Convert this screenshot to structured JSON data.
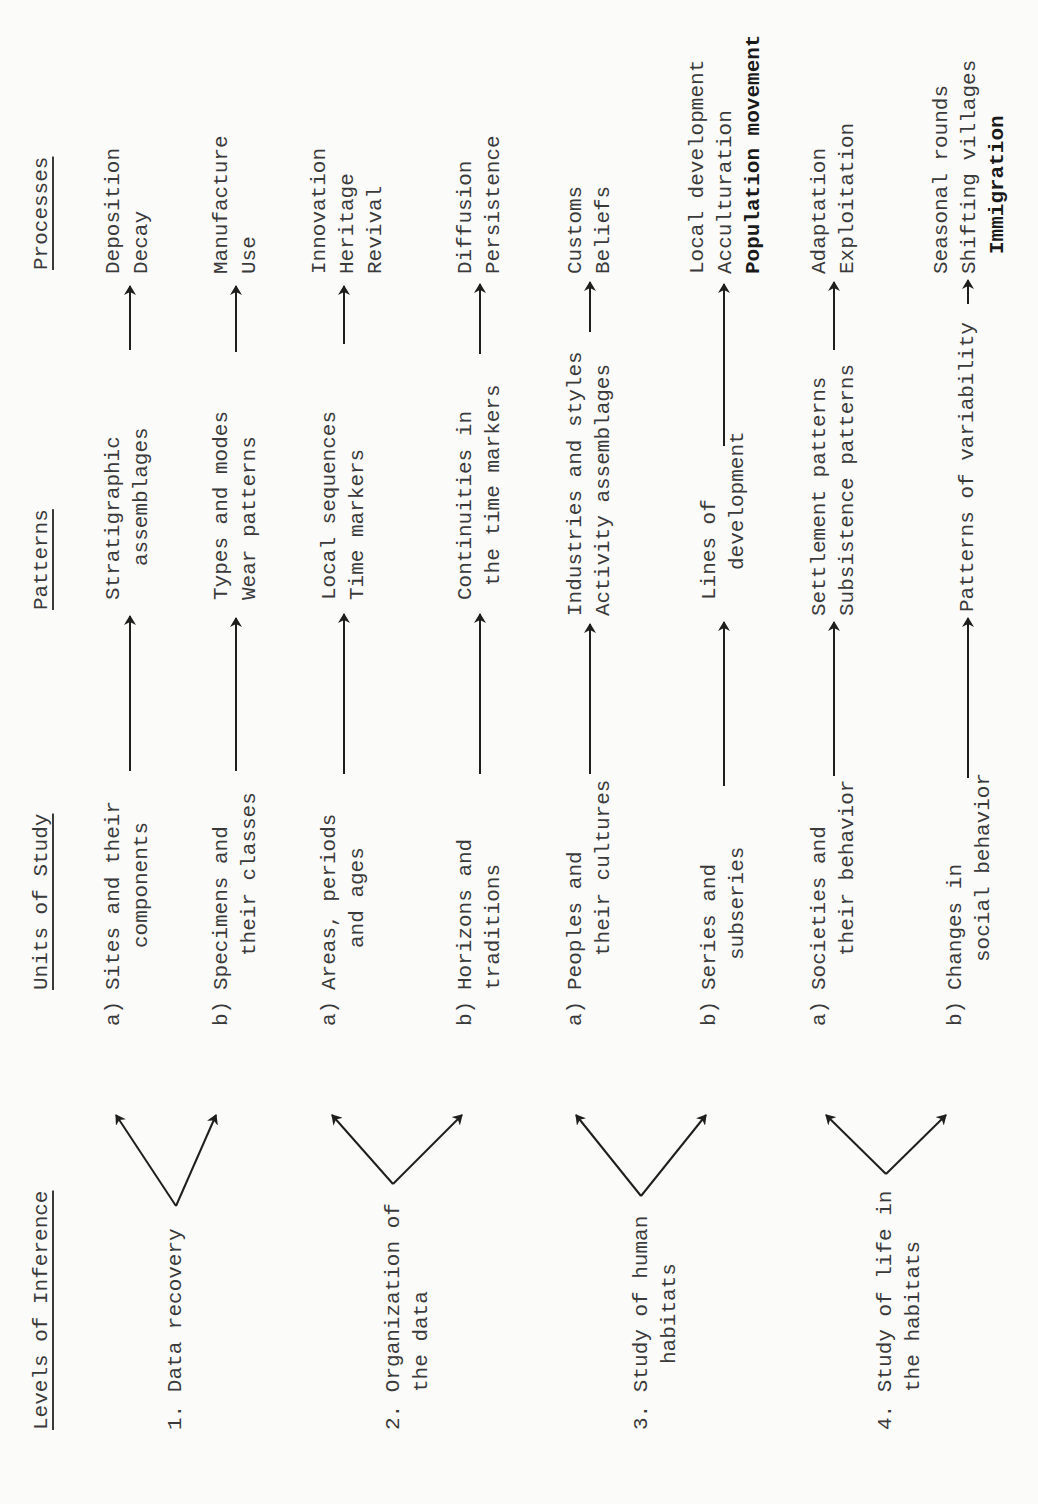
{
  "headers": {
    "levels": "Levels of Inference",
    "units": "Units of Study",
    "patterns": "Patterns",
    "processes": "Processes"
  },
  "levels": [
    {
      "num": "1.",
      "line1": "Data recovery",
      "line2": ""
    },
    {
      "num": "2.",
      "line1": "Organization of",
      "line2": "the data"
    },
    {
      "num": "3.",
      "line1": "Study of human",
      "line2": "habitats"
    },
    {
      "num": "4.",
      "line1": "Study of life in",
      "line2": "the habitats"
    }
  ],
  "rows": [
    {
      "tag": "a)",
      "unit": [
        "Sites and their",
        "components"
      ],
      "pattern": [
        "Stratigraphic",
        "assemblages"
      ],
      "process": [
        "Deposition",
        "Decay"
      ]
    },
    {
      "tag": "b)",
      "unit": [
        "Specimens and",
        "their classes"
      ],
      "pattern": [
        "Types and modes",
        "Wear patterns"
      ],
      "process": [
        "Manufacture",
        "Use"
      ]
    },
    {
      "tag": "a)",
      "unit": [
        "Areas, periods",
        "and ages"
      ],
      "pattern": [
        "Local sequences",
        "Time markers"
      ],
      "process": [
        "Innovation",
        "Heritage",
        "Revival"
      ]
    },
    {
      "tag": "b)",
      "unit": [
        "Horizons and",
        "traditions"
      ],
      "pattern": [
        "Continuities in",
        "the time markers"
      ],
      "process": [
        "Diffusion",
        "Persistence"
      ]
    },
    {
      "tag": "a)",
      "unit": [
        "Peoples and",
        "their cultures"
      ],
      "pattern": [
        "Industries and styles",
        "Activity assemblages"
      ],
      "process": [
        "Customs",
        "Beliefs"
      ]
    },
    {
      "tag": "b)",
      "unit": [
        "Series and",
        "subseries"
      ],
      "pattern": [
        "Lines of",
        "development"
      ],
      "process": [
        "Local development",
        "Acculturation",
        "Population movement"
      ]
    },
    {
      "tag": "a)",
      "unit": [
        "Societies and",
        "their behavior"
      ],
      "pattern": [
        "Settlement patterns",
        "Subsistence patterns"
      ],
      "process": [
        "Adaptation",
        "Exploitation"
      ]
    },
    {
      "tag": "b)",
      "unit": [
        "Changes in",
        "social behavior"
      ],
      "pattern": [
        "Patterns of variability"
      ],
      "process": [
        "Seasonal rounds",
        "Shifting villages",
        "Immigration"
      ]
    }
  ],
  "colors": {
    "ink": "#3a3a3a",
    "paper": "#fbfbfa"
  }
}
